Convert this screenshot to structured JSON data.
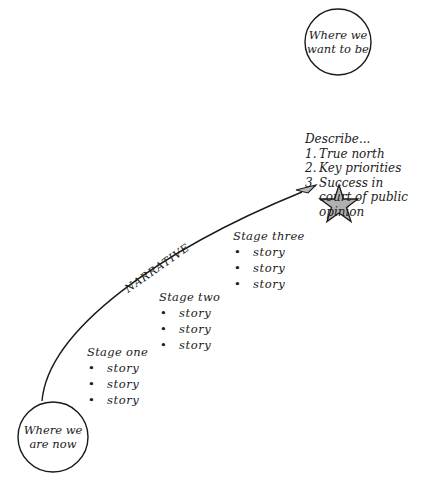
{
  "goal_circle": {
    "line1": "Where we",
    "line2": "want to be"
  },
  "start_circle": {
    "line1": "Where we",
    "line2": "are now"
  },
  "describe": {
    "heading": "Describe...",
    "items": [
      {
        "num": "1.",
        "lines": [
          "True north"
        ]
      },
      {
        "num": "2.",
        "lines": [
          "Key priorities"
        ]
      },
      {
        "num": "3.",
        "lines": [
          "Success in",
          "court of public",
          "opinion"
        ]
      }
    ]
  },
  "narrative_label": "NARRATIVE",
  "stages": [
    {
      "title": "Stage one",
      "items": [
        "story",
        "story",
        "story"
      ]
    },
    {
      "title": "Stage two",
      "items": [
        "story",
        "story",
        "story"
      ]
    },
    {
      "title": "Stage three",
      "items": [
        "story",
        "story",
        "story"
      ]
    }
  ],
  "colors": {
    "ink": "#1a1a1a",
    "star_fill": "#b0b0b0",
    "arrow_fill": "#b8b8b8",
    "background": "#ffffff"
  },
  "icons": {
    "goal_marker": "star-icon",
    "arrow_head": "arrowhead-icon"
  }
}
